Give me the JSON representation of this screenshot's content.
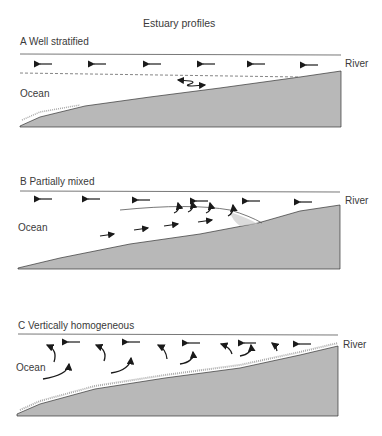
{
  "title": "Estuary profiles",
  "colors": {
    "seabed": "#b8b8b8",
    "line": "#444444",
    "arrow": "#1a1a1a",
    "stipple": "#9a9a9a"
  },
  "panels": [
    {
      "id": "A",
      "label": "A  Well stratified",
      "ocean_label": "Ocean",
      "river_label": "River",
      "features": [
        "surface seaward flow arrows (6)",
        "dashed halocline",
        "salt wedge interface wiggle arrow"
      ]
    },
    {
      "id": "B",
      "label": "B  Partially mixed",
      "ocean_label": "Ocean",
      "river_label": "River",
      "features": [
        "surface seaward flow arrows",
        "landward bottom flow arrows (4)",
        "upward mixing hooks (4)",
        "curved interface"
      ]
    },
    {
      "id": "C",
      "label": "C  Vertically homogeneous",
      "ocean_label": "Ocean",
      "river_label": "River",
      "features": [
        "surface seaward flow arrows",
        "vertical mixing eddies"
      ]
    }
  ]
}
